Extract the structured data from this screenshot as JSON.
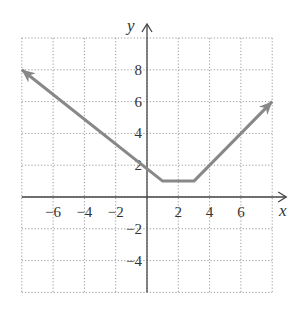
{
  "chart_data": {
    "type": "line",
    "title": "",
    "xlabel": "x",
    "ylabel": "y",
    "xlim": [
      -8,
      8
    ],
    "ylim": [
      -6,
      10
    ],
    "grid": true,
    "grid_step": 2,
    "x_ticks": [
      -6,
      -4,
      -2,
      2,
      4,
      6
    ],
    "y_ticks": [
      -4,
      -2,
      2,
      4,
      6,
      8
    ],
    "x_tick_labels": [
      "−6",
      "−4",
      "−2",
      "2",
      "4",
      "6"
    ],
    "y_tick_labels": [
      "−4",
      "−2",
      "2",
      "4",
      "6",
      "8"
    ],
    "series": [
      {
        "name": "f(x)",
        "color": "#888888",
        "points": [
          [
            -8,
            8
          ],
          [
            1,
            1
          ],
          [
            3,
            1
          ],
          [
            8,
            6
          ]
        ],
        "arrows": [
          "start",
          "end"
        ]
      }
    ]
  },
  "axes": {
    "x_label": "x",
    "y_label": "y"
  }
}
